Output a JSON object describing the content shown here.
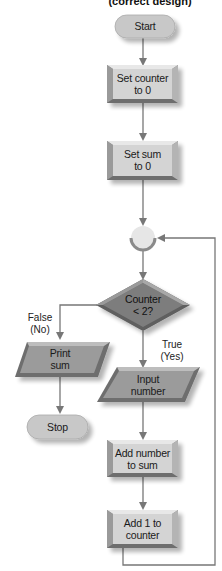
{
  "title": "(correct design)",
  "nodes": {
    "start": {
      "label": "Start",
      "shape": "terminal"
    },
    "set_counter": {
      "line1": "Set counter",
      "line2": "to 0",
      "shape": "process"
    },
    "set_sum": {
      "line1": "Set sum",
      "line2": "to 0",
      "shape": "process"
    },
    "connector": {
      "shape": "connector"
    },
    "decision": {
      "line1": "Counter",
      "line2": "< 2?",
      "shape": "decision"
    },
    "print_sum": {
      "line1": "Print",
      "line2": "sum",
      "shape": "input-output"
    },
    "stop": {
      "label": "Stop",
      "shape": "terminal"
    },
    "input_number": {
      "line1": "Input",
      "line2": "number",
      "shape": "input-output"
    },
    "add_number": {
      "line1": "Add number",
      "line2": "to sum",
      "shape": "process"
    },
    "add_one": {
      "line1": "Add 1 to",
      "line2": "counter",
      "shape": "process"
    }
  },
  "branches": {
    "false": {
      "line1": "False",
      "line2": "(No)"
    },
    "true": {
      "line1": "True",
      "line2": "(Yes)"
    }
  },
  "colors": {
    "process_fill": "#d4d4d4",
    "process_bevel_dark": "#8a8a8a",
    "io_fill": "#9b9b9b",
    "decision_fill": "#7d7d7d",
    "terminal_fill": "#c8c8c8",
    "connector_fill": "#e6e6e6",
    "line": "#777777"
  }
}
